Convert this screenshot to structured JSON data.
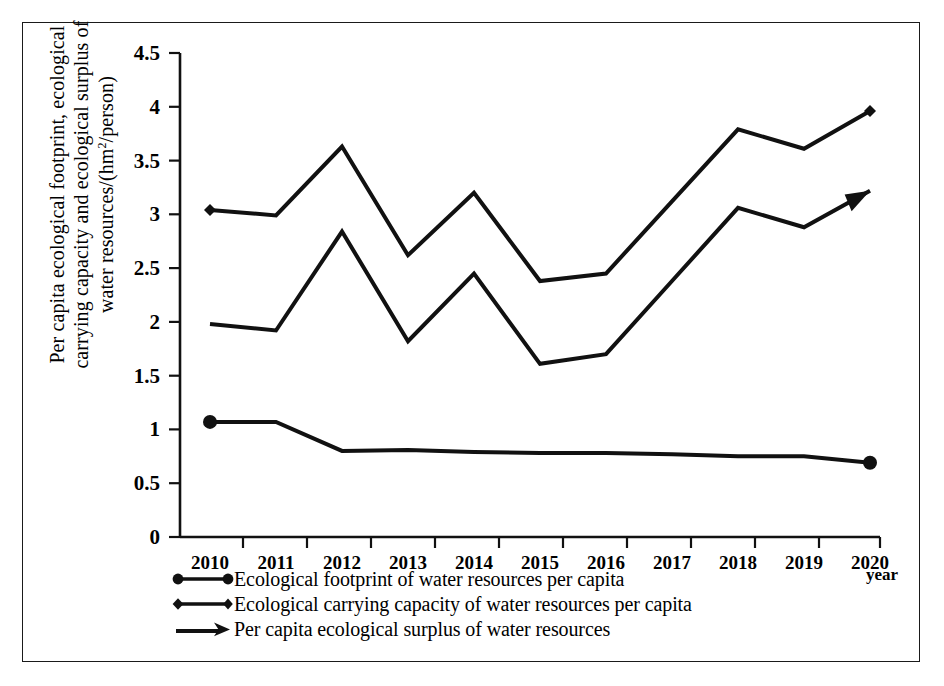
{
  "axes": {
    "ylabel_line1": "Per capita ecological footprint, ecological",
    "ylabel_line2": "carrying capacity and ecological surplus of",
    "ylabel_line3_a": "water resources/(hm",
    "ylabel_line3_sup": "2",
    "ylabel_line3_b": "/person)",
    "xlabel": "year"
  },
  "legend": {
    "items": [
      {
        "marker": "circle-line-icon",
        "label": "Ecological footprint of water resources per capita"
      },
      {
        "marker": "diamond-line-icon",
        "label": "Ecological carrying capacity of water resources per capita"
      },
      {
        "marker": "arrow-line-icon",
        "label": "Per capita ecological surplus of water resources"
      }
    ]
  },
  "chart_data": {
    "type": "line",
    "title": "",
    "xlabel": "year",
    "ylabel": "Per capita ecological footprint, ecological carrying capacity and ecological surplus of water resources/(hm2/person)",
    "categories": [
      "2010",
      "2011",
      "2012",
      "2013",
      "2014",
      "2015",
      "2016",
      "2017",
      "2018",
      "2019",
      "2020"
    ],
    "x": [
      2010,
      2011,
      2012,
      2013,
      2014,
      2015,
      2016,
      2017,
      2018,
      2019,
      2020
    ],
    "ylim": [
      0,
      4.5
    ],
    "yticks": [
      "0",
      "0.5",
      "1",
      "1.5",
      "2",
      "2.5",
      "3",
      "3.5",
      "4",
      "4.5"
    ],
    "ytick_values": [
      0,
      0.5,
      1,
      1.5,
      2,
      2.5,
      3,
      3.5,
      4,
      4.5
    ],
    "grid": false,
    "legend_position": "below-axes-left",
    "series": [
      {
        "name": "Ecological carrying capacity of water resources per capita",
        "marker": "diamond",
        "values": [
          3.04,
          2.99,
          3.63,
          2.62,
          3.2,
          2.38,
          2.45,
          3.12,
          3.79,
          3.61,
          3.96
        ]
      },
      {
        "name": "Per capita ecological surplus of water resources",
        "marker": "arrow",
        "values": [
          1.98,
          1.92,
          2.84,
          1.82,
          2.45,
          1.61,
          1.7,
          2.38,
          3.06,
          2.88,
          3.22
        ]
      },
      {
        "name": "Ecological footprint of water resources per capita",
        "marker": "circle",
        "values": [
          1.07,
          1.07,
          0.8,
          0.81,
          0.79,
          0.78,
          0.78,
          0.77,
          0.75,
          0.75,
          0.69
        ]
      }
    ]
  }
}
